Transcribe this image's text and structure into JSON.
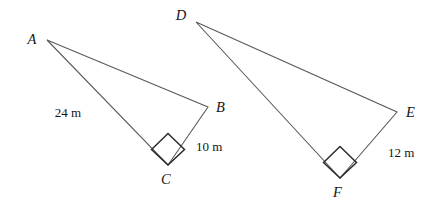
{
  "figure": {
    "background_color": "#ffffff",
    "stroke_color": "#5a5a5a",
    "label_color": "#151515",
    "triangles": [
      {
        "name": "triangle-abc",
        "vertices": [
          {
            "id": "A",
            "label": "A",
            "x": 47,
            "y": 40,
            "label_x": 32,
            "label_y": 44
          },
          {
            "id": "B",
            "label": "B",
            "x": 208,
            "y": 107,
            "label_x": 216,
            "label_y": 112
          },
          {
            "id": "C",
            "label": "C",
            "x": 168,
            "y": 165,
            "label_x": 161,
            "label_y": 184
          }
        ],
        "right_angle_at": "C",
        "sides": [
          {
            "name": "AC",
            "label": "24 m",
            "label_x": 68,
            "label_y": 117
          },
          {
            "name": "BC",
            "label": "10 m",
            "label_x": 196,
            "label_y": 151
          }
        ]
      },
      {
        "name": "triangle-def",
        "vertices": [
          {
            "id": "D",
            "label": "D",
            "x": 196,
            "y": 22,
            "label_x": 181,
            "label_y": 20
          },
          {
            "id": "E",
            "label": "E",
            "x": 397,
            "y": 112,
            "label_x": 406,
            "label_y": 117
          },
          {
            "id": "F",
            "label": "F",
            "x": 340,
            "y": 178,
            "label_x": 333,
            "label_y": 197
          }
        ],
        "right_angle_at": "F",
        "sides": [
          {
            "name": "EF",
            "label": "12 m",
            "label_x": 388,
            "label_y": 157
          }
        ]
      }
    ]
  }
}
